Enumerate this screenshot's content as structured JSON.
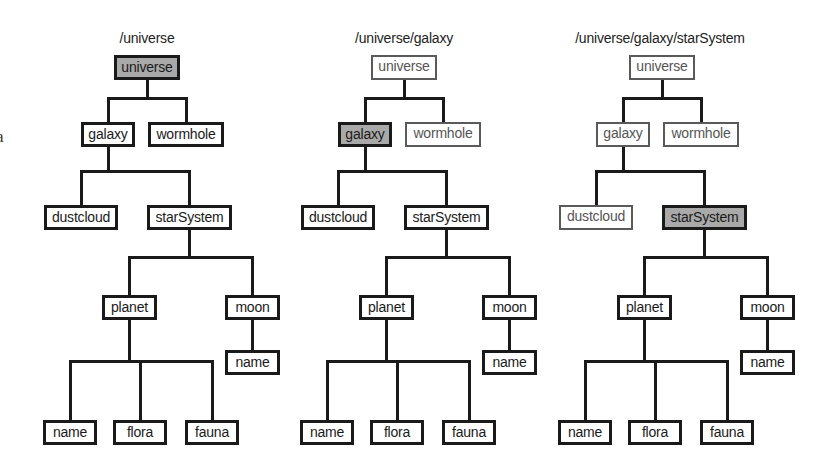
{
  "edge_fragment": "a",
  "colors": {
    "line": "#1a1a1a",
    "highlight_fill": "#a9a9a9",
    "dim_border": "#5a5a5a",
    "dim_text": "#555555"
  },
  "trees": [
    {
      "path_label": "/universe",
      "current": "universe",
      "dimmed": []
    },
    {
      "path_label": "/universe/galaxy",
      "current": "galaxy",
      "dimmed": [
        "universe",
        "wormhole"
      ]
    },
    {
      "path_label": "/universe/galaxy/starSystem",
      "current": "starSystem",
      "dimmed": [
        "universe",
        "galaxy",
        "wormhole",
        "dustcloud"
      ]
    }
  ],
  "nodes": {
    "universe": {
      "label": "universe"
    },
    "galaxy": {
      "label": "galaxy"
    },
    "wormhole": {
      "label": "wormhole"
    },
    "dustcloud": {
      "label": "dustcloud"
    },
    "starSystem": {
      "label": "starSystem"
    },
    "planet": {
      "label": "planet"
    },
    "moon": {
      "label": "moon"
    },
    "moon_name": {
      "label": "name"
    },
    "planet_name": {
      "label": "name"
    },
    "flora": {
      "label": "flora"
    },
    "fauna": {
      "label": "fauna"
    }
  }
}
